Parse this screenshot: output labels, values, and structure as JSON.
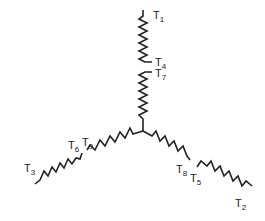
{
  "diagram": {
    "type": "wye-connected coil windings",
    "stroke_color": "#222222",
    "terminals": [
      {
        "id": "T1",
        "base": "T",
        "sub": "1"
      },
      {
        "id": "T2",
        "base": "T",
        "sub": "2"
      },
      {
        "id": "T3",
        "base": "T",
        "sub": "3"
      },
      {
        "id": "T4",
        "base": "T",
        "sub": "4"
      },
      {
        "id": "T5",
        "base": "T",
        "sub": "5"
      },
      {
        "id": "T6",
        "base": "T",
        "sub": "6"
      },
      {
        "id": "T7",
        "base": "T",
        "sub": "7"
      },
      {
        "id": "T8",
        "base": "T",
        "sub": "8"
      },
      {
        "id": "T9",
        "base": "T",
        "sub": "9"
      }
    ]
  }
}
